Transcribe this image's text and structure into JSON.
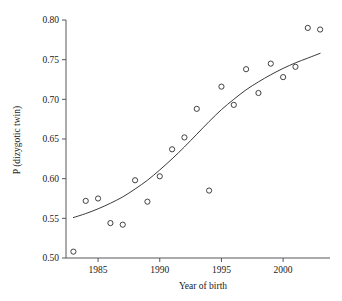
{
  "chart_data": {
    "type": "scatter",
    "title": "",
    "xlabel": "Year of birth",
    "ylabel": "P (dizygotic twin)",
    "xlim": [
      1982.4,
      2003.8
    ],
    "ylim": [
      0.5,
      0.8
    ],
    "xticks": [
      1985,
      1990,
      1995,
      2000
    ],
    "xtick_labels": [
      "1985",
      "1990",
      "1995",
      "2000"
    ],
    "yticks": [
      0.5,
      0.55,
      0.6,
      0.65,
      0.7,
      0.75,
      0.8
    ],
    "ytick_labels": [
      "0.50",
      "0.55",
      "0.60",
      "0.65",
      "0.70",
      "0.75",
      "0.80"
    ],
    "grid": false,
    "legend": null,
    "marker": "open-circle",
    "series": [
      {
        "name": "observed",
        "type": "scatter",
        "x": [
          1983,
          1984,
          1985,
          1986,
          1987,
          1988,
          1989,
          1990,
          1991,
          1992,
          1993,
          1994,
          1995,
          1996,
          1997,
          1998,
          1999,
          2000,
          2001,
          2002,
          2003
        ],
        "y": [
          0.508,
          0.572,
          0.575,
          0.544,
          0.542,
          0.598,
          0.571,
          0.603,
          0.637,
          0.652,
          0.688,
          0.585,
          0.716,
          0.693,
          0.738,
          0.708,
          0.745,
          0.728,
          0.741,
          0.79,
          0.788
        ]
      },
      {
        "name": "fitted-logistic-curve",
        "type": "line",
        "x": [
          1983,
          1984,
          1985,
          1986,
          1987,
          1988,
          1989,
          1990,
          1991,
          1992,
          1993,
          1994,
          1995,
          1996,
          1997,
          1998,
          1999,
          2000,
          2001,
          2002,
          2003
        ],
        "y": [
          0.551,
          0.556,
          0.562,
          0.569,
          0.577,
          0.587,
          0.598,
          0.611,
          0.625,
          0.64,
          0.656,
          0.672,
          0.687,
          0.7,
          0.712,
          0.722,
          0.731,
          0.739,
          0.746,
          0.752,
          0.758
        ]
      }
    ]
  },
  "axes": {
    "x_title": "Year of birth",
    "y_title": "P (dizygotic twin)"
  }
}
